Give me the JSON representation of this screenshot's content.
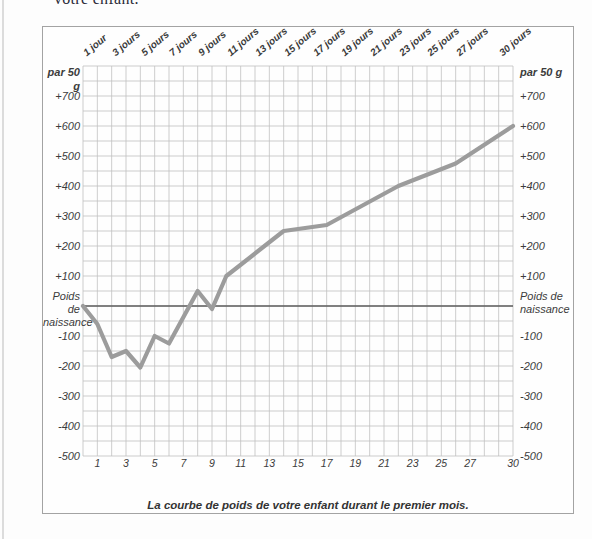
{
  "page": {
    "top_text": "votre enfant."
  },
  "chart": {
    "caption": "La courbe de poids de votre enfant durant le premier mois.",
    "unit_label": "par 50 g",
    "zero_label_line1": "Poids de",
    "zero_label_line2": "naissance",
    "colors": {
      "curve": "#9c9c9c",
      "grid": "#c0c0c0",
      "zero_line": "#5e5e5e",
      "text": "#3c3c3c",
      "box_border": "#a3a3a3"
    }
  },
  "chart_data": {
    "type": "line",
    "title": "La courbe de poids de votre enfant durant le premier mois.",
    "xlabel": "jours",
    "ylabel": "par 50 g",
    "x_range": [
      0,
      30
    ],
    "y_range": [
      -500,
      800
    ],
    "grid": "on, cells of 1 jour x 50 g",
    "legend": "none",
    "top_day_labels": [
      "1 jour",
      "3 jours",
      "5 jours",
      "7 jours",
      "9 jours",
      "11 jours",
      "13 jours",
      "15 jours",
      "17 jours",
      "19 jours",
      "21 jours",
      "23 jours",
      "25 jours",
      "27 jours",
      "30 jours"
    ],
    "top_label_days": [
      1,
      3,
      5,
      7,
      9,
      11,
      13,
      15,
      17,
      19,
      21,
      23,
      25,
      27,
      30
    ],
    "bottom_day_ticks": [
      "1",
      "3",
      "5",
      "7",
      "9",
      "11",
      "13",
      "15",
      "17",
      "19",
      "21",
      "23",
      "25",
      "27",
      "30"
    ],
    "bottom_tick_days": [
      1,
      3,
      5,
      7,
      9,
      11,
      13,
      15,
      17,
      19,
      21,
      23,
      25,
      27,
      30
    ],
    "y_ticks": [
      {
        "label": "+700",
        "grams": 700
      },
      {
        "label": "+600",
        "grams": 600
      },
      {
        "label": "+500",
        "grams": 500
      },
      {
        "label": "+400",
        "grams": 400
      },
      {
        "label": "+300",
        "grams": 300
      },
      {
        "label": "+200",
        "grams": 200
      },
      {
        "label": "+100",
        "grams": 100
      },
      {
        "label": "-100",
        "grams": -100
      },
      {
        "label": "-200",
        "grams": -200
      },
      {
        "label": "-300",
        "grams": -300
      },
      {
        "label": "-400",
        "grams": -400
      },
      {
        "label": "-500",
        "grams": -500
      }
    ],
    "zero_line_value": 0,
    "series": [
      {
        "name": "Courbe de poids (grammes par rapport au poids de naissance)",
        "points": [
          {
            "day": 0,
            "grams": 0
          },
          {
            "day": 1,
            "grams": -60
          },
          {
            "day": 2,
            "grams": -170
          },
          {
            "day": 3,
            "grams": -150
          },
          {
            "day": 4,
            "grams": -205
          },
          {
            "day": 5,
            "grams": -100
          },
          {
            "day": 6,
            "grams": -125
          },
          {
            "day": 8,
            "grams": 50
          },
          {
            "day": 9,
            "grams": -10
          },
          {
            "day": 10,
            "grams": 100
          },
          {
            "day": 14,
            "grams": 250
          },
          {
            "day": 17,
            "grams": 270
          },
          {
            "day": 22,
            "grams": 400
          },
          {
            "day": 26,
            "grams": 475
          },
          {
            "day": 30,
            "grams": 600
          }
        ]
      }
    ]
  }
}
